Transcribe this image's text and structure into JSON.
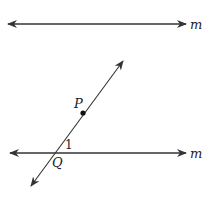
{
  "diagram": {
    "type": "geometry",
    "colors": {
      "stroke": "#333333",
      "background": "#ffffff"
    },
    "lines": [
      {
        "id": "top-line",
        "label": "m",
        "x1": 8,
        "y1": 24,
        "x2": 186,
        "y2": 24,
        "arrows": "both"
      },
      {
        "id": "bottom-line",
        "label": "m",
        "x1": 10,
        "y1": 153,
        "x2": 186,
        "y2": 153,
        "arrows": "both"
      },
      {
        "id": "transversal",
        "label": "",
        "x1": 31,
        "y1": 186,
        "x2": 123,
        "y2": 61,
        "arrows": "both"
      }
    ],
    "points": [
      {
        "id": "P",
        "label": "P",
        "x": 83,
        "y": 113
      },
      {
        "id": "Q",
        "label": "Q",
        "x": 54,
        "y": 153
      }
    ],
    "angle_labels": [
      {
        "id": "angle-1",
        "label": "1",
        "x": 66,
        "y": 148
      }
    ]
  }
}
